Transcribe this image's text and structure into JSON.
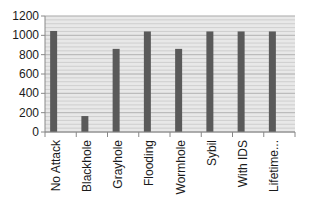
{
  "chart_data": {
    "type": "bar",
    "title": "",
    "xlabel": "",
    "ylabel": "",
    "categories": [
      "No Attack",
      "Blackhole",
      "Grayhole",
      "Flooding",
      "Wormhole",
      "Sybil",
      "With IDS",
      "Lifetime..."
    ],
    "values": [
      1045,
      165,
      860,
      1040,
      860,
      1040,
      1040,
      1040
    ],
    "ylim": [
      0,
      1200
    ],
    "yticks": [
      0,
      200,
      400,
      600,
      800,
      1000,
      1200
    ],
    "grid": true,
    "legend": null,
    "bar_color": "#5a5a5a",
    "plot_background": "#e8e8e8",
    "gridline_color": "#c8c8c8"
  }
}
